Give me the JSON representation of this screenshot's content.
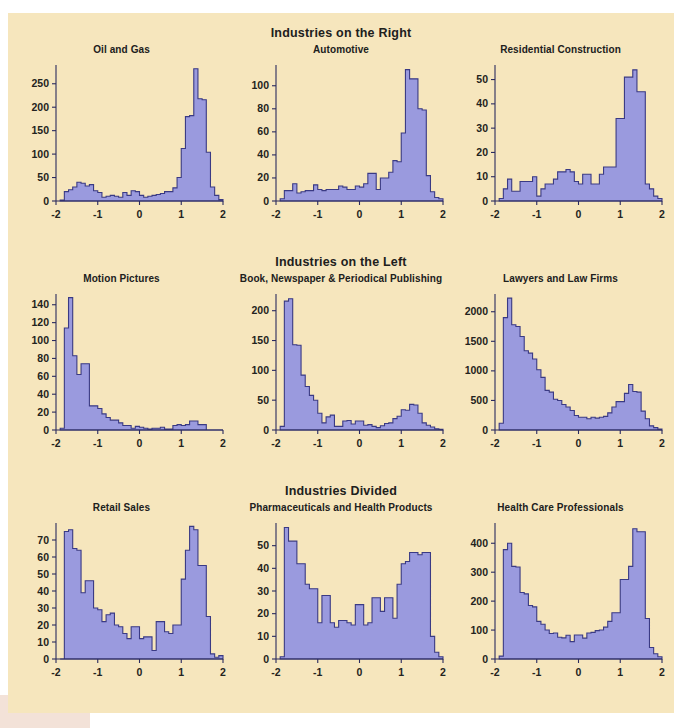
{
  "page": {
    "background_color": "#f6e6bd",
    "bar_fill_color": "#9a9ade",
    "bar_stroke_color": "#3a3a84",
    "text_color": "#20201c"
  },
  "sections": [
    {
      "id": "right",
      "heading": "Industries on the Right",
      "panels": [
        "oil-and-gas",
        "automotive",
        "residential-construction"
      ]
    },
    {
      "id": "left",
      "heading": "Industries on the Left",
      "panels": [
        "motion-pictures",
        "book-newspaper-periodical-publishing",
        "lawyers-and-law-firms"
      ]
    },
    {
      "id": "divided",
      "heading": "Industries Divided",
      "panels": [
        "retail-sales",
        "pharmaceuticals-and-health-products",
        "health-care-professionals"
      ]
    }
  ],
  "chart_data": [
    {
      "id": "oil-and-gas",
      "type": "bar",
      "title": "Oil and Gas",
      "xlabel": "",
      "ylabel": "",
      "xlim": [
        -2,
        2
      ],
      "ylim": [
        0,
        290
      ],
      "xticks": [
        -2,
        -1,
        0,
        1,
        2
      ],
      "xtick_labels": [
        "-2",
        "-1",
        "0",
        "1",
        "2"
      ],
      "yticks": [
        0,
        50,
        100,
        150,
        200,
        250
      ],
      "ytick_labels": [
        "0",
        "50",
        "100",
        "150",
        "200",
        "250"
      ],
      "ytick_shown": [
        0,
        100,
        150,
        200,
        250
      ],
      "grid": false,
      "bin_width": 0.1,
      "bin_starts": [
        -1.9,
        -1.8,
        -1.7,
        -1.6,
        -1.5,
        -1.4,
        -1.3,
        -1.2,
        -1.1,
        -1.0,
        -0.9,
        -0.8,
        -0.7,
        -0.6,
        -0.5,
        -0.4,
        -0.3,
        -0.2,
        -0.1,
        0.0,
        0.1,
        0.2,
        0.3,
        0.4,
        0.5,
        0.6,
        0.7,
        0.8,
        0.9,
        1.0,
        1.1,
        1.2,
        1.3,
        1.4,
        1.5,
        1.6,
        1.7,
        1.8,
        1.9
      ],
      "values": [
        2,
        20,
        24,
        30,
        40,
        38,
        32,
        35,
        22,
        18,
        8,
        10,
        12,
        10,
        8,
        18,
        12,
        22,
        20,
        12,
        8,
        10,
        12,
        14,
        16,
        20,
        20,
        28,
        50,
        112,
        180,
        182,
        282,
        218,
        216,
        104,
        30,
        12,
        3
      ]
    },
    {
      "id": "automotive",
      "type": "bar",
      "title": "Automotive",
      "xlabel": "",
      "ylabel": "",
      "xlim": [
        -2,
        2
      ],
      "ylim": [
        0,
        118
      ],
      "xticks": [
        -2,
        -1,
        0,
        1,
        2
      ],
      "xtick_labels": [
        "-2",
        "-1",
        "0",
        "1",
        "2"
      ],
      "yticks": [
        0,
        20,
        40,
        60,
        80,
        100
      ],
      "ytick_labels": [
        "0",
        "20",
        "40",
        "60",
        "80",
        "100"
      ],
      "grid": false,
      "bin_width": 0.1,
      "bin_starts": [
        -1.9,
        -1.8,
        -1.7,
        -1.6,
        -1.5,
        -1.4,
        -1.3,
        -1.2,
        -1.1,
        -1.0,
        -0.9,
        -0.8,
        -0.7,
        -0.6,
        -0.5,
        -0.4,
        -0.3,
        -0.2,
        -0.1,
        0.0,
        0.1,
        0.2,
        0.3,
        0.4,
        0.5,
        0.6,
        0.7,
        0.8,
        0.9,
        1.0,
        1.1,
        1.2,
        1.3,
        1.4,
        1.5,
        1.6,
        1.7,
        1.8,
        1.9
      ],
      "values": [
        2,
        9,
        9,
        15,
        7,
        8,
        9,
        9,
        14,
        10,
        9,
        10,
        10,
        10,
        13,
        12,
        10,
        10,
        13,
        12,
        15,
        24,
        24,
        10,
        20,
        20,
        25,
        35,
        34,
        59,
        114,
        106,
        106,
        80,
        79,
        22,
        8,
        3,
        2
      ]
    },
    {
      "id": "residential-construction",
      "type": "bar",
      "title": "Residential Construction",
      "xlabel": "",
      "ylabel": "",
      "xlim": [
        -2,
        2
      ],
      "ylim": [
        0,
        56
      ],
      "xticks": [
        -2,
        -1,
        0,
        1,
        2
      ],
      "xtick_labels": [
        "-2",
        "-1",
        "0",
        "1",
        "2"
      ],
      "yticks": [
        0,
        10,
        20,
        30,
        40,
        50
      ],
      "ytick_labels": [
        "0",
        "10",
        "20",
        "30",
        "40",
        "50"
      ],
      "grid": false,
      "bin_width": 0.1,
      "bin_starts": [
        -1.9,
        -1.8,
        -1.7,
        -1.6,
        -1.5,
        -1.4,
        -1.3,
        -1.2,
        -1.1,
        -1.0,
        -0.9,
        -0.8,
        -0.7,
        -0.6,
        -0.5,
        -0.4,
        -0.3,
        -0.2,
        -0.1,
        0.0,
        0.1,
        0.2,
        0.3,
        0.4,
        0.5,
        0.6,
        0.7,
        0.8,
        0.9,
        1.0,
        1.1,
        1.2,
        1.3,
        1.4,
        1.5,
        1.6,
        1.7,
        1.8,
        1.9
      ],
      "values": [
        1,
        5,
        9,
        4,
        4,
        8,
        8,
        8,
        10,
        2,
        5,
        7,
        7,
        9,
        12,
        12,
        13,
        12,
        8,
        7,
        11,
        11,
        7,
        7,
        11,
        14,
        14,
        14,
        34,
        34,
        51,
        51,
        54,
        45,
        45,
        7,
        5,
        2,
        1
      ]
    },
    {
      "id": "motion-pictures",
      "type": "bar",
      "title": "Motion Pictures",
      "xlabel": "",
      "ylabel": "",
      "xlim": [
        -2,
        2
      ],
      "ylim": [
        0,
        152
      ],
      "xticks": [
        -2,
        -1,
        0,
        1,
        2
      ],
      "xtick_labels": [
        "-2",
        "-1",
        "0",
        "1",
        "2"
      ],
      "yticks": [
        0,
        20,
        40,
        60,
        80,
        100,
        120,
        140
      ],
      "ytick_labels": [
        "0",
        "20",
        "40",
        "60",
        "80",
        "100",
        "120",
        "140"
      ],
      "grid": false,
      "bin_width": 0.1,
      "bin_starts": [
        -1.9,
        -1.8,
        -1.7,
        -1.6,
        -1.5,
        -1.4,
        -1.3,
        -1.2,
        -1.1,
        -1.0,
        -0.9,
        -0.8,
        -0.7,
        -0.6,
        -0.5,
        -0.4,
        -0.3,
        -0.2,
        -0.1,
        0.0,
        0.1,
        0.2,
        0.3,
        0.4,
        0.5,
        0.6,
        0.7,
        0.8,
        0.9,
        1.0,
        1.1,
        1.2,
        1.3,
        1.4,
        1.5,
        1.6,
        1.7,
        1.8,
        1.9
      ],
      "values": [
        2,
        114,
        148,
        83,
        62,
        74,
        74,
        27,
        27,
        24,
        18,
        14,
        11,
        11,
        8,
        5,
        5,
        2,
        4,
        3,
        2,
        1,
        2,
        2,
        3,
        1,
        1,
        5,
        6,
        5,
        6,
        10,
        10,
        6,
        6,
        0,
        0,
        0,
        0
      ]
    },
    {
      "id": "book-newspaper-periodical-publishing",
      "type": "bar",
      "title": "Book, Newspaper & Periodical Publishing",
      "xlabel": "",
      "ylabel": "",
      "xlim": [
        -2,
        2
      ],
      "ylim": [
        0,
        228
      ],
      "xticks": [
        -2,
        -1,
        0,
        1,
        2
      ],
      "xtick_labels": [
        "-2",
        "-1",
        "0",
        "1",
        "2"
      ],
      "yticks": [
        0,
        50,
        100,
        150,
        200
      ],
      "ytick_labels": [
        "0",
        "50",
        "100",
        "150",
        "200"
      ],
      "grid": false,
      "bin_width": 0.1,
      "bin_starts": [
        -1.9,
        -1.8,
        -1.7,
        -1.6,
        -1.5,
        -1.4,
        -1.3,
        -1.2,
        -1.1,
        -1.0,
        -0.9,
        -0.8,
        -0.7,
        -0.6,
        -0.5,
        -0.4,
        -0.3,
        -0.2,
        -0.1,
        0.0,
        0.1,
        0.2,
        0.3,
        0.4,
        0.5,
        0.6,
        0.7,
        0.8,
        0.9,
        1.0,
        1.1,
        1.2,
        1.3,
        1.4,
        1.5,
        1.6,
        1.7,
        1.8,
        1.9
      ],
      "values": [
        6,
        216,
        220,
        143,
        142,
        92,
        73,
        58,
        50,
        28,
        12,
        22,
        25,
        6,
        6,
        15,
        16,
        10,
        15,
        15,
        8,
        9,
        6,
        4,
        7,
        11,
        12,
        19,
        23,
        34,
        33,
        43,
        42,
        28,
        12,
        8,
        5,
        2,
        1
      ]
    },
    {
      "id": "lawyers-and-law-firms",
      "type": "bar",
      "title": "Lawyers and Law Firms",
      "xlabel": "",
      "ylabel": "",
      "xlim": [
        -2,
        2
      ],
      "ylim": [
        0,
        2300
      ],
      "xticks": [
        -2,
        -1,
        0,
        1,
        2
      ],
      "xtick_labels": [
        "-2",
        "-1",
        "0",
        "1",
        "2"
      ],
      "yticks": [
        0,
        500,
        1000,
        1500,
        2000
      ],
      "ytick_labels": [
        "0",
        "500",
        "1000",
        "1500",
        "2000"
      ],
      "grid": false,
      "bin_width": 0.1,
      "bin_starts": [
        -1.9,
        -1.8,
        -1.7,
        -1.6,
        -1.5,
        -1.4,
        -1.3,
        -1.2,
        -1.1,
        -1.0,
        -0.9,
        -0.8,
        -0.7,
        -0.6,
        -0.5,
        -0.4,
        -0.3,
        -0.2,
        -0.1,
        0.0,
        0.1,
        0.2,
        0.3,
        0.4,
        0.5,
        0.6,
        0.7,
        0.8,
        0.9,
        1.0,
        1.1,
        1.2,
        1.3,
        1.4,
        1.5,
        1.6,
        1.7,
        1.8,
        1.9
      ],
      "values": [
        115,
        1900,
        2230,
        1780,
        1750,
        1580,
        1340,
        1300,
        1200,
        1020,
        890,
        670,
        640,
        520,
        500,
        430,
        390,
        330,
        245,
        215,
        215,
        190,
        215,
        200,
        215,
        230,
        290,
        390,
        480,
        480,
        620,
        770,
        650,
        640,
        320,
        190,
        70,
        40,
        15
      ]
    },
    {
      "id": "retail-sales",
      "type": "bar",
      "title": "Retail Sales",
      "xlabel": "",
      "ylabel": "",
      "xlim": [
        -2,
        2
      ],
      "ylim": [
        0,
        80
      ],
      "xticks": [
        -2,
        -1,
        0,
        1,
        2
      ],
      "xtick_labels": [
        "-2",
        "-1",
        "0",
        "1",
        "2"
      ],
      "yticks": [
        0,
        10,
        20,
        30,
        40,
        50,
        60,
        70
      ],
      "ytick_labels": [
        "0",
        "10",
        "20",
        "30",
        "40",
        "50",
        "60",
        "70"
      ],
      "grid": false,
      "bin_width": 0.1,
      "bin_starts": [
        -1.9,
        -1.8,
        -1.7,
        -1.6,
        -1.5,
        -1.4,
        -1.3,
        -1.2,
        -1.1,
        -1.0,
        -0.9,
        -0.8,
        -0.7,
        -0.6,
        -0.5,
        -0.4,
        -0.3,
        -0.2,
        -0.1,
        0.0,
        0.1,
        0.2,
        0.3,
        0.4,
        0.5,
        0.6,
        0.7,
        0.8,
        0.9,
        1.0,
        1.1,
        1.2,
        1.3,
        1.4,
        1.5,
        1.6,
        1.7,
        1.8,
        1.9
      ],
      "values": [
        0,
        75,
        76,
        65,
        64,
        39,
        46,
        46,
        30,
        29,
        22,
        26,
        27,
        20,
        19,
        15,
        12,
        19,
        19,
        12,
        13,
        13,
        5,
        22,
        22,
        16,
        15,
        20,
        20,
        47,
        64,
        78,
        76,
        55,
        55,
        25,
        3,
        1,
        2
      ]
    },
    {
      "id": "pharmaceuticals-and-health-products",
      "type": "bar",
      "title": "Pharmaceuticals and Health Products",
      "xlabel": "",
      "ylabel": "",
      "xlim": [
        -2,
        2
      ],
      "ylim": [
        0,
        60
      ],
      "xticks": [
        -2,
        -1,
        0,
        1,
        2
      ],
      "xtick_labels": [
        "-2",
        "-1",
        "0",
        "1",
        "2"
      ],
      "yticks": [
        0,
        10,
        20,
        30,
        40,
        50
      ],
      "ytick_labels": [
        "0",
        "10",
        "20",
        "30",
        "40",
        "50"
      ],
      "grid": false,
      "bin_width": 0.1,
      "bin_starts": [
        -1.9,
        -1.8,
        -1.7,
        -1.6,
        -1.5,
        -1.4,
        -1.3,
        -1.2,
        -1.1,
        -1.0,
        -0.9,
        -0.8,
        -0.7,
        -0.6,
        -0.5,
        -0.4,
        -0.3,
        -0.2,
        -0.1,
        0.0,
        0.1,
        0.2,
        0.3,
        0.4,
        0.5,
        0.6,
        0.7,
        0.8,
        0.9,
        1.0,
        1.1,
        1.2,
        1.3,
        1.4,
        1.5,
        1.6,
        1.7,
        1.8,
        1.9
      ],
      "values": [
        1,
        58,
        52,
        52,
        42,
        42,
        33,
        31,
        31,
        16,
        28,
        28,
        16,
        14,
        17,
        17,
        16,
        15,
        24,
        24,
        15,
        16,
        27,
        27,
        21,
        27,
        27,
        18,
        33,
        42,
        43,
        47,
        47,
        46,
        47,
        47,
        10,
        3,
        1
      ]
    },
    {
      "id": "health-care-professionals",
      "type": "bar",
      "title": "Health Care Professionals",
      "xlabel": "",
      "ylabel": "",
      "xlim": [
        -2,
        2
      ],
      "ylim": [
        0,
        470
      ],
      "xticks": [
        -2,
        -1,
        0,
        1,
        2
      ],
      "xtick_labels": [
        "-2",
        "-1",
        "0",
        "1",
        "2"
      ],
      "yticks": [
        0,
        100,
        200,
        300,
        400
      ],
      "ytick_labels": [
        "0",
        "100",
        "200",
        "300",
        "400"
      ],
      "grid": false,
      "bin_width": 0.1,
      "bin_starts": [
        -1.9,
        -1.8,
        -1.7,
        -1.6,
        -1.5,
        -1.4,
        -1.3,
        -1.2,
        -1.1,
        -1.0,
        -0.9,
        -0.8,
        -0.7,
        -0.6,
        -0.5,
        -0.4,
        -0.3,
        -0.2,
        -0.1,
        0.0,
        0.1,
        0.2,
        0.3,
        0.4,
        0.5,
        0.6,
        0.7,
        0.8,
        0.9,
        1.0,
        1.1,
        1.2,
        1.3,
        1.4,
        1.5,
        1.6,
        1.7,
        1.8,
        1.9
      ],
      "values": [
        10,
        378,
        400,
        320,
        318,
        230,
        225,
        185,
        180,
        130,
        120,
        100,
        88,
        90,
        75,
        73,
        82,
        60,
        83,
        83,
        72,
        90,
        92,
        98,
        100,
        110,
        130,
        160,
        160,
        275,
        275,
        320,
        450,
        440,
        440,
        140,
        40,
        18,
        8
      ]
    }
  ]
}
